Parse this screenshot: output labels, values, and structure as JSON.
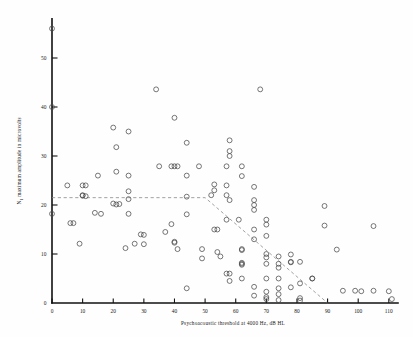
{
  "figure": {
    "background_color": "#fefefe",
    "marker_color": "#4a4a4a",
    "axis_color": "#111111",
    "fitline_color": "#8a8a8a"
  },
  "chart_data": {
    "type": "scatter",
    "title": "",
    "xlabel": "Psychoacoustic threshold at 4000 Hz, dB HL",
    "ylabel": "N1 maximum amplitude in microvolts",
    "xlim": [
      0,
      113
    ],
    "ylim": [
      0,
      58
    ],
    "xticks": [
      0,
      10,
      20,
      30,
      40,
      50,
      60,
      70,
      80,
      90,
      100,
      110
    ],
    "xticklabels": [
      "0",
      "10",
      "20",
      "30",
      "40",
      "50",
      "60",
      "70",
      "80",
      "90",
      "100",
      "110"
    ],
    "yticks": [
      0,
      10,
      20,
      30,
      40,
      50
    ],
    "yticklabels": [
      "0",
      "10",
      "20",
      "30",
      "40",
      "50"
    ],
    "grid": false,
    "legend": "none",
    "marker": "open-circle",
    "annotations": [
      {
        "name": "regression-fit",
        "type": "dashed-segmented-line",
        "description": "Flat at 21.5 uV from 0 to 50 dB HL, then declining to 0 uV at 90 dB HL",
        "points": [
          [
            0,
            21.5
          ],
          [
            50,
            21.5
          ],
          [
            90,
            0.0
          ]
        ]
      }
    ],
    "points": [
      [
        0,
        56.0
      ],
      [
        0,
        40.0
      ],
      [
        0,
        18.2
      ],
      [
        5,
        24.0
      ],
      [
        6,
        16.3
      ],
      [
        7,
        16.3
      ],
      [
        9,
        12.1
      ],
      [
        10,
        22.0
      ],
      [
        10,
        24.0
      ],
      [
        10,
        21.9
      ],
      [
        11,
        21.8
      ],
      [
        11,
        24.0
      ],
      [
        14,
        18.4
      ],
      [
        15,
        26.0
      ],
      [
        16,
        18.2
      ],
      [
        20,
        35.8
      ],
      [
        20,
        20.3
      ],
      [
        21,
        31.8
      ],
      [
        21,
        26.8
      ],
      [
        21,
        20.1
      ],
      [
        22,
        20.2
      ],
      [
        24,
        11.2
      ],
      [
        25,
        35.0
      ],
      [
        25,
        26.0
      ],
      [
        25,
        22.8
      ],
      [
        25,
        21.2
      ],
      [
        25,
        18.2
      ],
      [
        27,
        12.1
      ],
      [
        29,
        14.0
      ],
      [
        30,
        13.9
      ],
      [
        30,
        12.0
      ],
      [
        34,
        43.6
      ],
      [
        35,
        27.9
      ],
      [
        37,
        14.5
      ],
      [
        39,
        27.9
      ],
      [
        39,
        16.1
      ],
      [
        40,
        37.8
      ],
      [
        40,
        27.9
      ],
      [
        40,
        12.5
      ],
      [
        40,
        12.3
      ],
      [
        41,
        27.9
      ],
      [
        41,
        11.0
      ],
      [
        44,
        32.7
      ],
      [
        44,
        26.0
      ],
      [
        44,
        21.7
      ],
      [
        44,
        18.1
      ],
      [
        44,
        3.0
      ],
      [
        48,
        27.9
      ],
      [
        49,
        11.0
      ],
      [
        49,
        9.1
      ],
      [
        52,
        22.0
      ],
      [
        53,
        24.2
      ],
      [
        53,
        23.0
      ],
      [
        53,
        15.0
      ],
      [
        54,
        15.0
      ],
      [
        54,
        10.4
      ],
      [
        55,
        9.5
      ],
      [
        57,
        27.9
      ],
      [
        57,
        24.0
      ],
      [
        57,
        22.0
      ],
      [
        57,
        17.0
      ],
      [
        57,
        6.0
      ],
      [
        58,
        6.0
      ],
      [
        58,
        4.5
      ],
      [
        58,
        33.2
      ],
      [
        58,
        31.0
      ],
      [
        58,
        30.0
      ],
      [
        58,
        21.0
      ],
      [
        61,
        17.0
      ],
      [
        62,
        27.9
      ],
      [
        62,
        25.9
      ],
      [
        62,
        11.0
      ],
      [
        62,
        10.8
      ],
      [
        62,
        8.2
      ],
      [
        62,
        8.0
      ],
      [
        62,
        7.8
      ],
      [
        62,
        5.0
      ],
      [
        66,
        23.7
      ],
      [
        66,
        21.0
      ],
      [
        66,
        20.0
      ],
      [
        66,
        19.0
      ],
      [
        66,
        15.0
      ],
      [
        66,
        13.0
      ],
      [
        66,
        3.3
      ],
      [
        66,
        1.5
      ],
      [
        68,
        43.6
      ],
      [
        70,
        17.0
      ],
      [
        70,
        16.0
      ],
      [
        70,
        13.7
      ],
      [
        70,
        10.0
      ],
      [
        70,
        9.3
      ],
      [
        70,
        8.0
      ],
      [
        70,
        5.0
      ],
      [
        70,
        2.3
      ],
      [
        70,
        1.2
      ],
      [
        70,
        0.8
      ],
      [
        74,
        9.5
      ],
      [
        74,
        8.0
      ],
      [
        74,
        7.2
      ],
      [
        74,
        5.0
      ],
      [
        74,
        3.0
      ],
      [
        74,
        1.8
      ],
      [
        74,
        0.6
      ],
      [
        78,
        9.9
      ],
      [
        78,
        8.4
      ],
      [
        78,
        8.3
      ],
      [
        78,
        3.2
      ],
      [
        81,
        8.4
      ],
      [
        81,
        4.0
      ],
      [
        81,
        1.0
      ],
      [
        81,
        0.5
      ],
      [
        85,
        5.0
      ],
      [
        85,
        5.0
      ],
      [
        89,
        19.8
      ],
      [
        89,
        15.8
      ],
      [
        93,
        10.9
      ],
      [
        95,
        2.5
      ],
      [
        99,
        2.5
      ],
      [
        101,
        2.4
      ],
      [
        105,
        15.7
      ],
      [
        105,
        2.5
      ],
      [
        110,
        2.4
      ],
      [
        111,
        0.8
      ]
    ]
  }
}
